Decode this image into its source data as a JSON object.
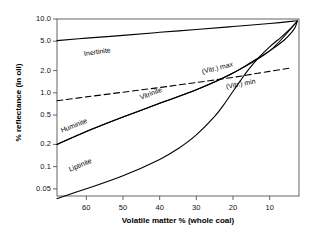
{
  "chart_data": {
    "type": "line",
    "title": "",
    "xlabel": "Volatile  matter %  (whole coal)",
    "ylabel": "% reflectance (in oil)",
    "yscale": "log",
    "ylim": [
      0.04,
      10.0
    ],
    "xlim": [
      68,
      2
    ],
    "x_reversed": true,
    "grid": false,
    "legend": "inline-annotations",
    "yticks": [
      {
        "value": 10.0,
        "label": "10.0"
      },
      {
        "value": 5.0,
        "label": "5.0"
      },
      {
        "value": 2.0,
        "label": "2.0"
      },
      {
        "value": 1.0,
        "label": "1.0"
      },
      {
        "value": 0.5,
        "label": "0.5"
      },
      {
        "value": 0.2,
        "label": "0.2"
      },
      {
        "value": 0.1,
        "label": "0.1"
      },
      {
        "value": 0.05,
        "label": "0.05"
      }
    ],
    "xticks": [
      {
        "value": 60,
        "label": "60"
      },
      {
        "value": 50,
        "label": "50"
      },
      {
        "value": 40,
        "label": "40"
      },
      {
        "value": 30,
        "label": "30"
      },
      {
        "value": 20,
        "label": "20"
      },
      {
        "value": 10,
        "label": "10"
      }
    ],
    "series": [
      {
        "name": "Inertinite",
        "style": "solid",
        "points": [
          [
            68,
            5.1
          ],
          [
            60,
            5.5
          ],
          [
            50,
            6.0
          ],
          [
            40,
            6.6
          ],
          [
            30,
            7.2
          ],
          [
            20,
            7.9
          ],
          [
            10,
            8.7
          ],
          [
            4,
            9.3
          ],
          [
            2.5,
            9.5
          ]
        ]
      },
      {
        "name": "(Vitr.) max",
        "style": "solid",
        "points": [
          [
            68,
            0.2
          ],
          [
            60,
            0.3
          ],
          [
            50,
            0.47
          ],
          [
            40,
            0.72
          ],
          [
            30,
            1.1
          ],
          [
            25,
            1.4
          ],
          [
            20,
            1.85
          ],
          [
            15,
            2.6
          ],
          [
            10,
            3.7
          ],
          [
            6,
            5.2
          ],
          [
            4,
            6.6
          ],
          [
            3,
            7.8
          ],
          [
            2.5,
            9.3
          ]
        ]
      },
      {
        "name": "(Vitr.) min",
        "style": "dashed",
        "points": [
          [
            68,
            0.78
          ],
          [
            60,
            0.88
          ],
          [
            50,
            1.02
          ],
          [
            40,
            1.18
          ],
          [
            30,
            1.38
          ],
          [
            20,
            1.62
          ],
          [
            15,
            1.78
          ],
          [
            10,
            1.95
          ],
          [
            6,
            2.1
          ],
          [
            4,
            2.18
          ]
        ]
      },
      {
        "name": "Huminite",
        "style": "solid",
        "points": [
          [
            68,
            0.2
          ],
          [
            60,
            0.3
          ],
          [
            50,
            0.47
          ],
          [
            40,
            0.72
          ]
        ]
      },
      {
        "name": "Vitrinite",
        "style": "solid",
        "points": [
          [
            40,
            0.72
          ],
          [
            30,
            1.1
          ],
          [
            20,
            1.85
          ],
          [
            10,
            3.7
          ],
          [
            2.5,
            9.3
          ]
        ]
      },
      {
        "name": "Liptinite",
        "style": "solid",
        "points": [
          [
            68,
            0.037
          ],
          [
            60,
            0.05
          ],
          [
            50,
            0.075
          ],
          [
            40,
            0.125
          ],
          [
            35,
            0.175
          ],
          [
            30,
            0.27
          ],
          [
            25,
            0.48
          ],
          [
            22,
            0.75
          ],
          [
            20,
            1.05
          ],
          [
            18,
            1.45
          ],
          [
            16,
            2.0
          ],
          [
            13,
            3.0
          ],
          [
            10,
            4.2
          ],
          [
            7,
            5.6
          ],
          [
            5,
            6.9
          ],
          [
            3.5,
            8.2
          ],
          [
            2.5,
            9.3
          ]
        ]
      }
    ],
    "annotations": [
      {
        "text": "Inertinite",
        "x_px": 84,
        "y_px": 50,
        "rotation": -8
      },
      {
        "text": "Huminite",
        "x_px": 61,
        "y_px": 127,
        "rotation": -22
      },
      {
        "text": "Vitrinite",
        "x_px": 140,
        "y_px": 94,
        "rotation": -21
      },
      {
        "text": "Liptinite",
        "x_px": 69,
        "y_px": 166,
        "rotation": -23
      },
      {
        "text": "(Vitr.) max",
        "x_px": 202,
        "y_px": 68,
        "rotation": -14
      },
      {
        "text": "(Vitr.) min",
        "x_px": 226,
        "y_px": 83,
        "rotation": -11
      }
    ]
  },
  "axes": {
    "frame": {
      "left": 57,
      "right": 299,
      "top": 19,
      "bottom": 196
    },
    "axis_color": "#555555",
    "curve_color": "#000000"
  }
}
